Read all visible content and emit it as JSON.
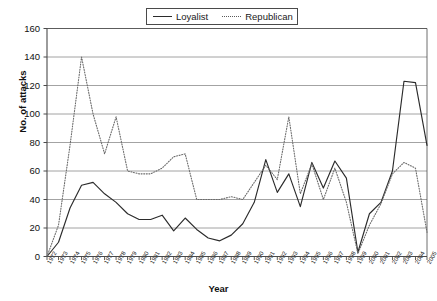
{
  "chart_data": {
    "type": "line",
    "title": "",
    "xlabel": "Year",
    "ylabel": "No. of attacks",
    "ylim": [
      0,
      160
    ],
    "ytick_step": 20,
    "yticks": [
      0,
      20,
      40,
      60,
      80,
      100,
      120,
      140,
      160
    ],
    "grid": "horizontal",
    "legend_position": "top-center",
    "categories": [
      "1972",
      "1973",
      "1974",
      "1975",
      "1976",
      "1977",
      "1978",
      "1979",
      "1980",
      "1981",
      "1982",
      "1983",
      "1984",
      "1985",
      "1986",
      "1987",
      "1988",
      "1989",
      "1990",
      "1991",
      "1992",
      "1993",
      "1994",
      "1995",
      "1996",
      "1997",
      "1998",
      "1999",
      "2000",
      "2001",
      "2002",
      "2003",
      "2004",
      "2005"
    ],
    "series": [
      {
        "name": "Loyalist",
        "style": "solid",
        "color": "#2b2b2b",
        "values": [
          0,
          10,
          34,
          50,
          52,
          44,
          38,
          30,
          26,
          26,
          29,
          18,
          27,
          19,
          13,
          11,
          15,
          23,
          38,
          68,
          45,
          58,
          35,
          66,
          48,
          67,
          55,
          3,
          30,
          38,
          27,
          52,
          78,
          110
        ],
        "values_note": "see values_full for full precision",
        "values_full": [
          0,
          10,
          34,
          50,
          52,
          44,
          38,
          30,
          26,
          26,
          29,
          18,
          27,
          19,
          13,
          11,
          15,
          23,
          38,
          68,
          45,
          58,
          35,
          66,
          48,
          67,
          55,
          3,
          30,
          38,
          27,
          52,
          78,
          110
        ]
      },
      {
        "name": "Republican",
        "style": "dotted",
        "color": "#6b6b6b",
        "values": [
          0,
          22,
          78,
          140,
          100,
          72,
          98,
          60,
          58,
          58,
          62,
          70,
          72,
          40,
          40,
          40,
          42,
          40,
          52,
          64,
          54,
          98,
          44,
          65,
          40,
          62,
          38,
          2,
          22,
          37,
          30,
          44,
          28,
          17
        ]
      }
    ],
    "series_plotted": {
      "Loyalist": [
        0,
        10,
        34,
        50,
        52,
        44,
        38,
        30,
        26,
        26,
        29,
        18,
        27,
        19,
        13,
        11,
        15,
        23,
        38,
        68,
        45,
        58,
        35,
        66,
        48,
        67,
        55,
        3,
        30,
        38,
        60,
        123,
        122,
        78
      ],
      "Republican": [
        0,
        22,
        78,
        140,
        100,
        72,
        98,
        60,
        58,
        58,
        62,
        70,
        72,
        40,
        40,
        40,
        42,
        40,
        52,
        64,
        54,
        98,
        44,
        65,
        40,
        62,
        38,
        2,
        22,
        37,
        58,
        66,
        62,
        17
      ]
    }
  },
  "legend": {
    "entries": [
      {
        "label": "Loyalist",
        "style": "solid"
      },
      {
        "label": "Republican",
        "style": "dotted"
      }
    ]
  },
  "axes": {
    "y_title": "No. of attacks",
    "x_title": "Year"
  }
}
